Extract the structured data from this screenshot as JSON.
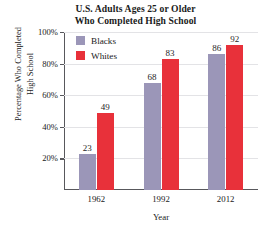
{
  "chart_data": {
    "type": "bar",
    "title": "U.S. Adults Ages 25 or Older Who Completed High School",
    "title_lines": [
      "U.S. Adults Ages 25 or Older",
      "Who Completed High School"
    ],
    "xlabel": "Year",
    "ylabel": "Percentage Who Completed High School",
    "ylabel_lines": [
      "Percentage Who Completed",
      "High School"
    ],
    "categories": [
      "1962",
      "1992",
      "2012"
    ],
    "series": [
      {
        "name": "Blacks",
        "color": "#9b96b8",
        "values": [
          23,
          68,
          86
        ],
        "value_labels": [
          "23",
          "68",
          "86"
        ]
      },
      {
        "name": "Whites",
        "color": "#e8313a",
        "values": [
          49,
          83,
          92
        ],
        "value_labels": [
          "49",
          "83",
          "92"
        ]
      }
    ],
    "ylim": [
      0,
      100
    ],
    "yticks": [
      20,
      40,
      60,
      80,
      100
    ],
    "ytick_labels": [
      "20%",
      "40%",
      "60%",
      "80%",
      "100%"
    ],
    "grid": true,
    "legend_position": "top-left-inside",
    "legend_entries": [
      "Blacks",
      "Whites"
    ],
    "axis_color": "#58585c",
    "grid_color": "#e3e3e6"
  }
}
